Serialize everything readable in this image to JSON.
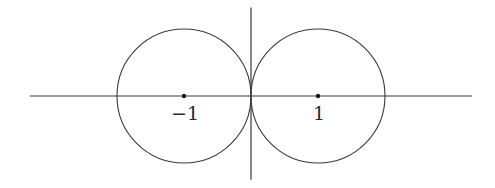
{
  "figure": {
    "stroke_color": "#3a3a3a",
    "axes": {
      "x_range": [
        -3.3,
        3.3
      ],
      "y_range": [
        -1.25,
        1.32
      ]
    },
    "circles": [
      {
        "name": "left-circle",
        "center": [
          -1,
          0
        ],
        "radius": 1
      },
      {
        "name": "right-circle",
        "center": [
          1,
          0
        ],
        "radius": 1
      }
    ],
    "points": [
      {
        "name": "point-minus-one",
        "x": -1,
        "y": 0,
        "label": "−1"
      },
      {
        "name": "point-one",
        "x": 1,
        "y": 0,
        "label": "1"
      }
    ]
  }
}
